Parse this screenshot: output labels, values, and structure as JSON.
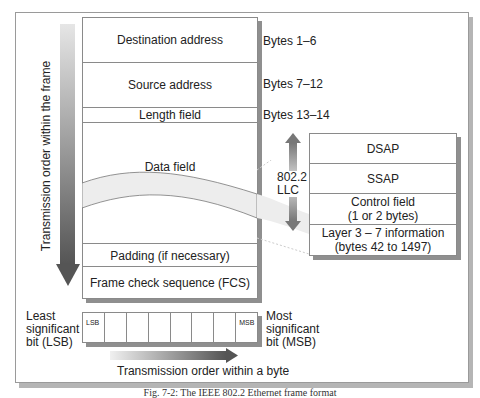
{
  "frame": {
    "rows": [
      {
        "label": "Destination address",
        "bytes": "Bytes  1–6"
      },
      {
        "label": "Source address",
        "bytes": "Bytes  7–12"
      },
      {
        "label": "Length field",
        "bytes": "Bytes  13–14"
      },
      {
        "label": "Data field",
        "bytes": ""
      },
      {
        "label": "Padding (if necessary)",
        "bytes": ""
      },
      {
        "label": "Frame check sequence (FCS)",
        "bytes": ""
      }
    ],
    "vertical_arrow_label": "Transmission order within the frame"
  },
  "llc": {
    "label_line1": "802.2",
    "label_line2": "LLC",
    "rows": [
      {
        "line1": "DSAP",
        "line2": ""
      },
      {
        "line1": "SSAP",
        "line2": ""
      },
      {
        "line1": "Control field",
        "line2": "(1 or 2 bytes)"
      },
      {
        "line1": "Layer 3 – 7 information",
        "line2": "(bytes 42 to 1497)"
      }
    ]
  },
  "byte": {
    "cells": [
      "LSB",
      "",
      "",
      "",
      "",
      "",
      "",
      "MSB"
    ],
    "left_label": [
      "Least",
      "significant",
      "bit (LSB)"
    ],
    "right_label": [
      "Most",
      "significant",
      "bit (MSB)"
    ],
    "arrow_label": "Transmission order within a byte"
  },
  "caption": "Fig. 7-2: The IEEE 802.2 Ethernet frame format"
}
